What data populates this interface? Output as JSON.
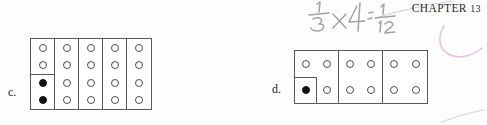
{
  "page": {
    "background_color": "#fdfdfd",
    "width": 487,
    "height": 125
  },
  "header": {
    "chapter_text": "CHAPTER",
    "chapter_number": "13"
  },
  "annotations": {
    "handwritten_expression": "1/3 x 4 = 1/12",
    "handwritten_expression_parts": {
      "fraction_one_third": "1/3",
      "operator": "x",
      "operand": "4",
      "equals": "=",
      "result": "1/12"
    },
    "pencil_color": "#9a9a96",
    "swash_color": "#e2cbe2",
    "swash_label": "pink-curved-mark",
    "top_diagonal_label": "faint-diagonal-stroke",
    "bottom_stroke_label": "faint-bottom-stroke"
  },
  "items": [
    {
      "letter": "c.",
      "name": "item-c",
      "figure": {
        "type": "column-grid",
        "columns": 5,
        "dots_per_column": 4,
        "dot_states": [
          [
            "open",
            "open",
            "filled",
            "filled"
          ],
          [
            "open",
            "open",
            "open",
            "open"
          ],
          [
            "open",
            "open",
            "open",
            "open"
          ],
          [
            "open",
            "open",
            "open",
            "open"
          ],
          [
            "open",
            "open",
            "open",
            "open"
          ]
        ],
        "split_columns": [
          0
        ],
        "split_after_dot": 2,
        "border_color": "#5a5a5a",
        "fill_color": "#ffffff"
      }
    },
    {
      "letter": "d.",
      "name": "item-d",
      "figure": {
        "type": "box-grid",
        "boxes": 3,
        "rows_per_box": 2,
        "cols_per_box": 2,
        "dot_states": [
          [
            [
              "open",
              "open"
            ],
            [
              "filled",
              "open"
            ]
          ],
          [
            [
              "open",
              "open"
            ],
            [
              "open",
              "open"
            ]
          ],
          [
            [
              "open",
              "open"
            ],
            [
              "open",
              "open"
            ]
          ]
        ],
        "subbox_in_box": 0,
        "subbox_position": "bottom-left",
        "border_color": "#5a5a5a",
        "fill_color": "#ffffff"
      }
    }
  ]
}
